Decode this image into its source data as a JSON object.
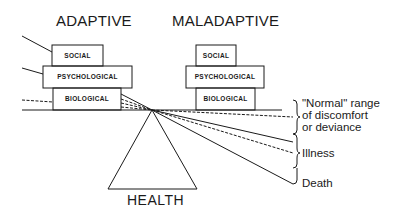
{
  "diagram": {
    "columns": {
      "adaptive": {
        "title": "ADAPTIVE",
        "boxes": [
          "SOCIAL",
          "PSYCHOLOGICAL",
          "BIOLOGICAL"
        ]
      },
      "maladaptive": {
        "title": "MALADAPTIVE",
        "boxes": [
          "SOCIAL",
          "PSYCHOLOGICAL",
          "BIOLOGICAL"
        ]
      }
    },
    "fulcrum_label": "HEALTH",
    "ranges": {
      "normal": {
        "line1": "\"Normal\" range",
        "line2": "of discomfort",
        "line3": "or deviance"
      },
      "illness": "Illness",
      "death": "Death"
    },
    "colors": {
      "ink": "#1a1a1a",
      "background": "#ffffff"
    }
  }
}
